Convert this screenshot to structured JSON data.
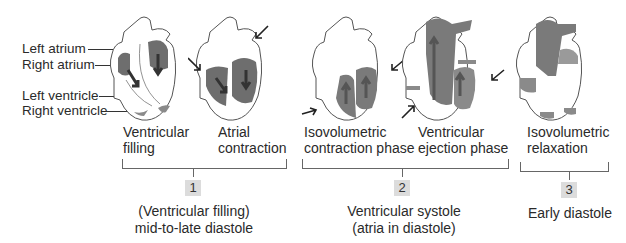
{
  "figure": {
    "structure_labels": [
      "Left atrium",
      "Right atrium",
      "Left ventricle",
      "Right ventricle"
    ],
    "panels": [
      {
        "line1": "Ventricular",
        "line2": "filling"
      },
      {
        "line1": "Atrial",
        "line2": "contraction"
      },
      {
        "line1": "Isovolumetric",
        "line2": "contraction phase"
      },
      {
        "line1": "Ventricular",
        "line2": "ejection phase"
      },
      {
        "line1": "Isovolumetric",
        "line2": "relaxation"
      }
    ],
    "groups": [
      {
        "number": "1",
        "line1": "(Ventricular filling)",
        "line2": "mid-to-late diastole"
      },
      {
        "number": "2",
        "line1": "Ventricular systole",
        "line2": "(atria in diastole)"
      },
      {
        "number": "3",
        "line1": "Early diastole",
        "line2": ""
      }
    ],
    "colors": {
      "blood_dark": "#6e6e6e",
      "blood_light": "#9a9a9a",
      "outline": "#555555",
      "badge": "#dcdcdc"
    }
  }
}
